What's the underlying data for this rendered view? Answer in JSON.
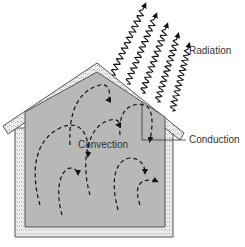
{
  "diagram": {
    "labels": {
      "radiation": "Radiation",
      "conduction": "Conduction",
      "convection": "Convection"
    },
    "icons": {
      "radiation": "wavy-arrow",
      "convection": "dashed-arrow",
      "conduction": "leader-line"
    },
    "colors": {
      "interior": "#b8b8b8",
      "wall": "#e6e6e6",
      "outline": "#555555",
      "arrow": "#111111",
      "text": "#333333"
    },
    "radiation_ray_count": 5,
    "convection_current_count": 7
  }
}
